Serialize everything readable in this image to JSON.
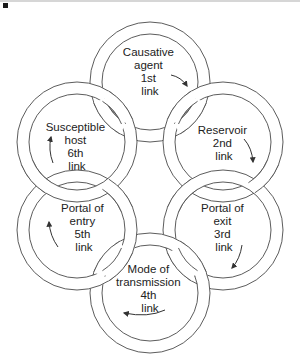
{
  "links": [
    {
      "id": "causative-agent",
      "lines": [
        "Causative",
        "agent",
        "1st",
        "link"
      ]
    },
    {
      "id": "reservoir",
      "lines": [
        "Reservoir",
        "2nd",
        "link"
      ]
    },
    {
      "id": "portal-of-exit",
      "lines": [
        "Portal of",
        "exit",
        "3rd",
        "link"
      ]
    },
    {
      "id": "mode-of-transmission",
      "lines": [
        "Mode of",
        "transmission",
        "4th",
        "link"
      ]
    },
    {
      "id": "portal-of-entry",
      "lines": [
        "Portal of",
        "entry",
        "5th",
        "link"
      ]
    },
    {
      "id": "susceptible-host",
      "lines": [
        "Susceptible",
        "host",
        "6th",
        "link"
      ]
    }
  ],
  "arrows": [
    {
      "from": "causative-agent",
      "to": "reservoir",
      "direction": "clockwise"
    },
    {
      "from": "reservoir",
      "to": "portal-of-exit",
      "direction": "clockwise"
    },
    {
      "from": "portal-of-exit",
      "to": "mode-of-transmission",
      "direction": "clockwise"
    },
    {
      "from": "mode-of-transmission",
      "to": "portal-of-entry",
      "direction": "clockwise"
    },
    {
      "from": "portal-of-entry",
      "to": "susceptible-host",
      "direction": "clockwise"
    },
    {
      "from": "susceptible-host",
      "to": "causative-agent",
      "direction": "clockwise"
    }
  ],
  "colors": {
    "line": "#4a4a4a",
    "text": "#222222",
    "background": "#ffffff"
  }
}
